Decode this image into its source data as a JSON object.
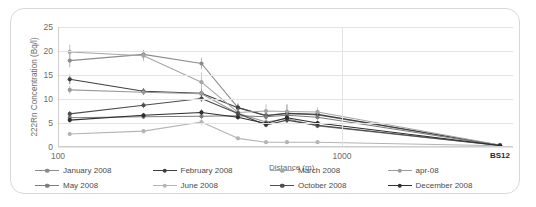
{
  "chart_data": {
    "type": "line",
    "title": "",
    "xlabel": "Distance (m)",
    "ylabel": "222Rn Concentration (Bq/l)",
    "xscale": "log",
    "xlim": [
      100,
      4000
    ],
    "ylim": [
      0,
      25
    ],
    "yticks": [
      0,
      5,
      10,
      15,
      20,
      25
    ],
    "xticks": [
      100,
      1000
    ],
    "xtick_labels": [
      "100",
      "1000"
    ],
    "extra_xtick_label": "BS12",
    "extra_xtick_value": 3600,
    "grid": "horizontal",
    "legend_position": "bottom",
    "error_bars": true,
    "x": [
      110,
      200,
      320,
      430,
      540,
      640,
      820,
      3600
    ],
    "series": [
      {
        "name": "January 2008",
        "color": "#8c8c8c",
        "values": [
          18.0,
          19.3,
          17.4,
          8.2,
          6.6,
          7.0,
          6.7,
          0.35
        ],
        "errors": [
          1.4,
          0.9,
          1.2,
          0.9,
          0.8,
          1.9,
          0.9,
          0.1
        ]
      },
      {
        "name": "February 2008",
        "color": "#3f3f3f",
        "values": [
          14.1,
          11.6,
          11.2,
          8.2,
          6.5,
          7.0,
          6.8,
          0.35
        ],
        "errors": [
          1.0,
          0.7,
          1.0,
          0.7,
          0.7,
          0.7,
          0.7,
          0.1
        ]
      },
      {
        "name": "March 2008",
        "color": "#a6a6a6",
        "values": [
          19.8,
          19.0,
          13.5,
          7.2,
          7.5,
          7.4,
          7.3,
          0.4
        ],
        "errors": [
          1.5,
          1.1,
          2.0,
          0.9,
          1.4,
          1.4,
          0.9,
          0.1
        ]
      },
      {
        "name": "apr-08",
        "color": "#9a9a9a",
        "values": [
          11.9,
          11.4,
          11.1,
          7.0,
          5.2,
          5.9,
          4.4,
          0.3
        ],
        "errors": [
          0.8,
          0.6,
          0.7,
          0.6,
          0.6,
          0.6,
          0.5,
          0.1
        ]
      },
      {
        "name": "May 2008",
        "color": "#7d7d7d",
        "values": [
          6.1,
          6.3,
          6.4,
          6.5,
          6.3,
          6.6,
          6.2,
          0.3
        ],
        "errors": [
          0.6,
          0.5,
          0.6,
          0.5,
          0.5,
          0.5,
          0.5,
          0.1
        ]
      },
      {
        "name": "June 2008",
        "color": "#b4b4b4",
        "values": [
          2.7,
          3.3,
          5.2,
          1.8,
          1.0,
          1.0,
          1.0,
          0.25
        ],
        "errors": [
          0.4,
          0.4,
          0.6,
          0.3,
          0.2,
          0.2,
          0.2,
          0.05
        ]
      },
      {
        "name": "October 2008",
        "color": "#4d4d4d",
        "values": [
          6.9,
          8.7,
          10.1,
          7.0,
          4.6,
          5.6,
          4.5,
          0.3
        ],
        "errors": [
          0.6,
          0.6,
          0.7,
          0.6,
          0.5,
          0.6,
          0.5,
          0.1
        ]
      },
      {
        "name": "December 2008",
        "color": "#2e2e2e",
        "values": [
          5.6,
          6.6,
          7.2,
          6.2,
          4.9,
          6.1,
          5.0,
          0.3
        ],
        "errors": [
          0.5,
          0.5,
          0.6,
          0.5,
          0.5,
          0.5,
          0.5,
          0.1
        ]
      }
    ]
  },
  "legend": {
    "items": [
      {
        "label": "January 2008"
      },
      {
        "label": "February 2008"
      },
      {
        "label": "March 2008"
      },
      {
        "label": "apr-08"
      },
      {
        "label": "May 2008"
      },
      {
        "label": "June 2008"
      },
      {
        "label": "October 2008"
      },
      {
        "label": "December 2008"
      }
    ]
  }
}
